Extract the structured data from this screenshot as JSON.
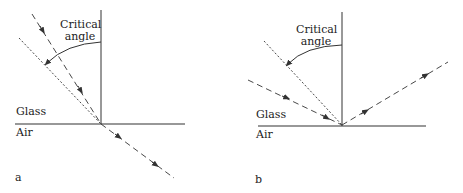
{
  "panels": [
    {
      "id": "a",
      "letter": "a",
      "critical_label_1": "Critical",
      "critical_label_2": "angle",
      "upper_medium": "Glass",
      "lower_medium": "Air",
      "case": "refraction at critical angle"
    },
    {
      "id": "b",
      "letter": "b",
      "critical_label_1": "Critical",
      "critical_label_2": "angle",
      "upper_medium": "Glass",
      "lower_medium": "Air",
      "case": "total internal reflection"
    }
  ],
  "colors": {
    "line": "#333333",
    "background": "#ffffff"
  }
}
